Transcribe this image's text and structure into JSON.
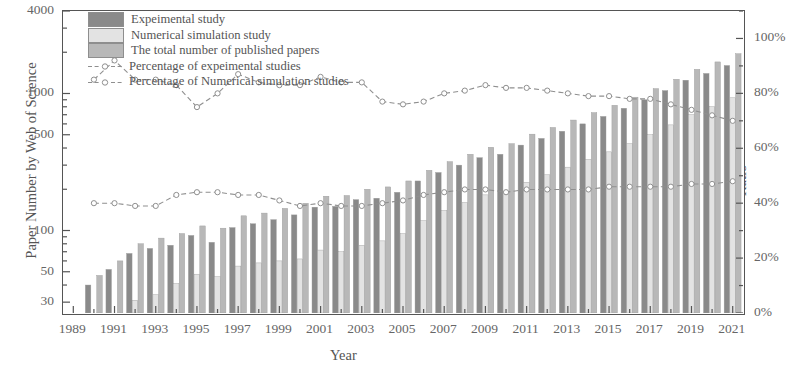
{
  "chart_data": {
    "type": "bar",
    "title": "",
    "xlabel": "Year",
    "ylabel": "Paper Number by Web of Science",
    "ylabel_right": "Ratio",
    "yscale": "log",
    "ylim": [
      25,
      4000
    ],
    "y_ticks": [
      30,
      50,
      100,
      500,
      1000,
      4000
    ],
    "y_tick_labels": [
      "30",
      "50",
      "100",
      "500",
      "1000",
      "4000"
    ],
    "ylim_right": [
      0,
      110
    ],
    "y_ticks_right": [
      0,
      20,
      40,
      60,
      80,
      100
    ],
    "y_tick_labels_right": [
      "0%",
      "20%",
      "40%",
      "60%",
      "80%",
      "100%"
    ],
    "grid": false,
    "legend_position": "upper-left",
    "categories": [
      1989,
      1990,
      1991,
      1992,
      1993,
      1994,
      1995,
      1996,
      1997,
      1998,
      1999,
      2000,
      2001,
      2002,
      2003,
      2004,
      2005,
      2006,
      2007,
      2008,
      2009,
      2010,
      2011,
      2012,
      2013,
      2014,
      2015,
      2016,
      2017,
      2018,
      2019,
      2020,
      2021
    ],
    "x_tick_labels": [
      "1989",
      "1991",
      "1993",
      "1995",
      "1997",
      "1999",
      "2001",
      "2003",
      "2005",
      "2007",
      "2009",
      "2011",
      "2013",
      "2015",
      "2017",
      "2019",
      "2021"
    ],
    "series": [
      {
        "name": "Expeimental study",
        "type": "bar",
        "color": "#8a8a8a",
        "values": [
          0,
          40,
          52,
          68,
          74,
          78,
          92,
          82,
          105,
          112,
          120,
          130,
          148,
          150,
          168,
          172,
          190,
          230,
          265,
          300,
          340,
          360,
          420,
          470,
          530,
          600,
          680,
          780,
          900,
          1050,
          1250,
          1400,
          1600
        ]
      },
      {
        "name": "Numerical simulation study",
        "type": "bar",
        "color": "#e3e3e3",
        "values": [
          0,
          19,
          24,
          31,
          34,
          41,
          48,
          46,
          55,
          58,
          60,
          62,
          72,
          70,
          78,
          84,
          95,
          118,
          140,
          160,
          182,
          190,
          225,
          255,
          290,
          330,
          375,
          430,
          500,
          590,
          700,
          800,
          930
        ]
      },
      {
        "name": "The total number of published papers",
        "type": "bar",
        "color": "#b8b8b8",
        "values": [
          0,
          47,
          60,
          80,
          88,
          95,
          108,
          104,
          128,
          134,
          145,
          158,
          178,
          180,
          200,
          208,
          230,
          275,
          318,
          360,
          405,
          430,
          505,
          565,
          640,
          725,
          820,
          940,
          1085,
          1270,
          1500,
          1700,
          1950
        ]
      },
      {
        "name": "Percentage of expeimental studies",
        "type": "line",
        "marker": "o",
        "color": "#8f8f8f",
        "values": [
          null,
          85,
          92,
          85,
          85,
          83,
          75,
          80,
          87,
          84,
          83,
          83,
          86,
          84,
          84,
          77,
          76,
          77,
          80,
          81,
          83,
          82,
          82,
          81,
          80,
          79,
          79,
          78,
          78,
          76,
          74,
          72,
          70
        ]
      },
      {
        "name": "Percentage of Numerical simulation studies",
        "type": "line",
        "marker": "o",
        "color": "#8f8f8f",
        "values": [
          null,
          40,
          40,
          39,
          39,
          43,
          44,
          44,
          43,
          43,
          41,
          39,
          40,
          39,
          39,
          40,
          41,
          43,
          44,
          45,
          45,
          44,
          45,
          45,
          45,
          45,
          46,
          46,
          46,
          46,
          47,
          47,
          48
        ]
      }
    ]
  },
  "legend": {
    "items": [
      {
        "label": "Expeimental study"
      },
      {
        "label": "Numerical simulation study"
      },
      {
        "label": "The total number of published papers"
      },
      {
        "label": "Percentage of expeimental studies"
      },
      {
        "label": "Percentage of Numerical simulation studies"
      }
    ]
  }
}
